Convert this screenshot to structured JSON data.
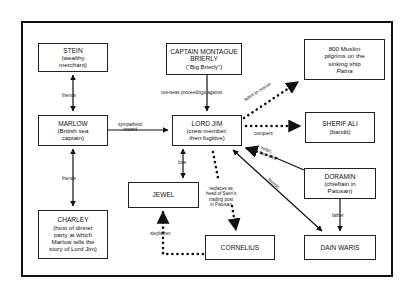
{
  "diagram": {
    "type": "character-relationship-map",
    "nodes": {
      "stein": {
        "name": "STEIN",
        "desc1": "(wealthy",
        "desc2": "merchant)"
      },
      "brierly": {
        "name1": "CAPTAIN MONTAGUE",
        "name2": "BRIERLY",
        "desc": "(“Big Brierly”)"
      },
      "pilgrims": {
        "line1": "800 Muslim",
        "line2": "pilgrims on the",
        "line3": "sinking ship",
        "line4": "Patna"
      },
      "marlow": {
        "name": "MARLOW",
        "desc1": "(British sea",
        "desc2": "captain)"
      },
      "lord_jim": {
        "name": "LORD JIM",
        "desc1": "(crew member,",
        "desc2": "then fugitive)"
      },
      "sherif_ali": {
        "name": "SHERIF ALI",
        "desc": "(bandit)"
      },
      "jewel": {
        "name": "JEWEL"
      },
      "charley": {
        "name": "CHARLEY",
        "desc1": "(host of dinner",
        "desc2": "party at which",
        "desc3": "Marlow tells the",
        "desc4": "story of Lord Jim)"
      },
      "cornelius": {
        "name": "CORNELIUS"
      },
      "doramin": {
        "name": "DORAMIN",
        "desc1": "(chieftain in",
        "desc2": "Patusan)"
      },
      "dain_waris": {
        "name": "DAIN WARIS"
      }
    },
    "edges": {
      "stein_marlow": "friends",
      "marlow_charley": "friends",
      "marlow_jim": {
        "l1": "sympathetic",
        "l2": "toward"
      },
      "brierly_jim": "overseas proceedings against",
      "jim_pilgrims": "failed to rescue",
      "jim_sherif": "conquers",
      "doramin_jim": {
        "l1": "helps,",
        "l2": "then kills"
      },
      "jim_dain": "friends",
      "jim_jewel": "love",
      "jim_cornelius": {
        "l1": "replaces as",
        "l2": "head of Stein's",
        "l3": "trading post",
        "l4": "in Patusan"
      },
      "cornelius_jewel": "stepfather",
      "doramin_dain": "father"
    }
  }
}
